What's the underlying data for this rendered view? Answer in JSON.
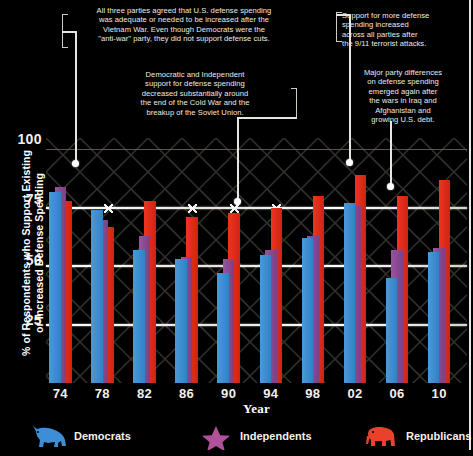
{
  "chart_data": {
    "type": "bar",
    "title": "",
    "xlabel": "Year",
    "ylabel": "% of Respondents who Support Existing or Increased Defense Spending",
    "categories": [
      "74",
      "78",
      "82",
      "86",
      "90",
      "94",
      "98",
      "02",
      "06",
      "10"
    ],
    "yticks": [
      25,
      50,
      75,
      100
    ],
    "ylim": [
      0,
      105
    ],
    "grid": true,
    "legend_position": "bottom",
    "series": [
      {
        "name": "Democrats",
        "color": "#3c8fd4",
        "values": [
          82,
          74,
          57,
          53,
          47,
          55,
          62,
          77,
          45,
          56
        ]
      },
      {
        "name": "Independents",
        "color": "#8a4a8f",
        "values": [
          84,
          70,
          63,
          54,
          53,
          57,
          63,
          76,
          57,
          58
        ]
      },
      {
        "name": "Republicans",
        "color": "#e02b18",
        "values": [
          78,
          67,
          78,
          71,
          73,
          75,
          80,
          89,
          80,
          87
        ]
      }
    ],
    "annotations": [
      {
        "id": "anno-1974",
        "text": "All three parties agreed that U.S. defense spending was adequate or needed to be increased after the Vietnam War. Even though Democrats were the \"anti-war\" party, they did not support defense cuts.",
        "target_category": "74"
      },
      {
        "id": "anno-1990",
        "text": "Democratic and Independent support for defense spending decreased substantially around the end of the Cold War and the breakup of the Soviet Union.",
        "target_category": "90"
      },
      {
        "id": "anno-2002",
        "text": "Support for more defense spending increased across all parties after the 9/11 terrorist attacks.",
        "target_category": "02"
      },
      {
        "id": "anno-2006",
        "text": "Major party differences on defense spending emerged again after the wars in Iraq and Afghanistan and growing U.S. debt.",
        "target_category": "06"
      }
    ]
  },
  "yaxis": {
    "title_line1": "% of Respondents who Support Existing",
    "title_line2": "or Increased Defense Spending",
    "ticks": [
      "100",
      "75",
      "50",
      "25"
    ]
  },
  "xaxis": {
    "title": "Year",
    "ticks": [
      "74",
      "78",
      "82",
      "86",
      "90",
      "94",
      "98",
      "02",
      "06",
      "10"
    ]
  },
  "annotations": {
    "a1": {
      "line1": "All three parties agreed that U.S. defense spending",
      "line2": "was adequate or needed to be increased after the",
      "line3": "Vietnam War. Even though Democrats were the",
      "line4": "\"anti-war\" party, they did not support defense cuts."
    },
    "a2": {
      "line1": "Democratic and Independent",
      "line2": "support for defense spending",
      "line3": "decreased substantially around",
      "line4": "the end of the Cold War and the",
      "line5": "breakup of the Soviet Union."
    },
    "a3": {
      "line1": "Support for more defense",
      "line2": "spending increased",
      "line3": "across all parties after",
      "line4": "the 9/11 terrorist attacks."
    },
    "a4": {
      "line1": "Major party differences",
      "line2": "on defense spending",
      "line3": "emerged again after",
      "line4": "the wars in Iraq and",
      "line5": "Afghanistan and",
      "line6": "growing U.S. debt."
    }
  },
  "legend": {
    "items": [
      {
        "label": "Democrats",
        "icon": "donkey-icon",
        "color": "#3c8fd4"
      },
      {
        "label": "Independents",
        "icon": "star-icon",
        "color": "#b0519c"
      },
      {
        "label": "Republicans",
        "icon": "elephant-icon",
        "color": "#e8412c"
      }
    ]
  }
}
